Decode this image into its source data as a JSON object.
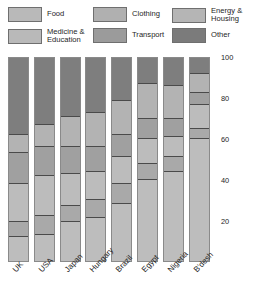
{
  "legend": {
    "items": [
      {
        "label": "Food",
        "color": "#b9b9b9",
        "col": 0,
        "row": 0
      },
      {
        "label": "Medicine &\nEducation",
        "color": "#b9b9b9",
        "col": 0,
        "row": 1
      },
      {
        "label": "Clothing",
        "color": "#b0b0b0",
        "col": 1,
        "row": 0
      },
      {
        "label": "Transport",
        "color": "#9b9b9b",
        "col": 1,
        "row": 1
      },
      {
        "label": "Energy &\nHousing",
        "color": "#b5b5b5",
        "col": 2,
        "row": 0
      },
      {
        "label": "Other",
        "color": "#7b7b7b",
        "col": 2,
        "row": 1
      }
    ]
  },
  "chart_data": {
    "type": "bar",
    "stacked": true,
    "title": "",
    "xlabel": "",
    "ylabel": "",
    "ylim": [
      0,
      100
    ],
    "yticks": [
      20,
      40,
      60,
      80,
      100
    ],
    "grid": false,
    "legend_position": "top",
    "categories": [
      "UK",
      "USA",
      "Japan",
      "Hungary",
      "Brazil",
      "Egypt",
      "Nigeria",
      "B'desh"
    ],
    "series": [
      {
        "name": "Food",
        "color": "#bdbdbd",
        "values": [
          12,
          13,
          19,
          21,
          28,
          40,
          44,
          60
        ]
      },
      {
        "name": "Medicine & Education",
        "color": "#a9a9a9",
        "values": [
          7,
          9,
          8,
          9,
          10,
          8,
          7,
          5
        ]
      },
      {
        "name": "Clothing",
        "color": "#bcbcbc",
        "values": [
          19,
          20,
          16,
          14,
          13,
          12,
          10,
          12
        ]
      },
      {
        "name": "Transport",
        "color": "#a0a0a0",
        "values": [
          15,
          14,
          13,
          12,
          11,
          10,
          9,
          6
        ]
      },
      {
        "name": "Energy & Housing",
        "color": "#b3b3b3",
        "values": [
          9,
          11,
          15,
          17,
          17,
          17,
          16,
          9
        ]
      },
      {
        "name": "Other",
        "color": "#7e7e7e",
        "values": [
          38,
          33,
          29,
          27,
          21,
          13,
          14,
          8
        ]
      }
    ]
  }
}
